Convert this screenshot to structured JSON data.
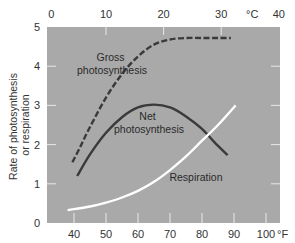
{
  "chart_data": {
    "type": "line",
    "title": "",
    "xlabel": "°F",
    "xlabel_top": "°C",
    "ylabel": "Rate of photosynthesis or respiration",
    "ylabel_lines": [
      "Rate of photosynthesis",
      "or respiration"
    ],
    "xlim_f": [
      32,
      104
    ],
    "ylim": [
      0,
      5
    ],
    "x_ticks_bottom": [
      40,
      50,
      60,
      70,
      80,
      90,
      100
    ],
    "x_ticks_bottom_labels": [
      "40",
      "50",
      "60",
      "70",
      "80",
      "90",
      "100"
    ],
    "x_ticks_top_c": [
      0,
      10,
      20,
      30,
      40
    ],
    "x_ticks_top_labels": [
      "0",
      "10",
      "20",
      "30",
      "40"
    ],
    "y_ticks": [
      0,
      1,
      2,
      3,
      4,
      5
    ],
    "y_ticks_labels": [
      "0",
      "1",
      "2",
      "3",
      "4",
      "5"
    ],
    "grid": false,
    "legend": "inline labels",
    "background": "#a9a9a9",
    "series": [
      {
        "name": "Gross photosynthesis",
        "label_lines": [
          "Gross",
          "photosynthesis"
        ],
        "style": "dashed",
        "color": "#3a3a3a",
        "x": [
          39.5,
          42,
          45,
          50,
          55,
          60,
          65,
          70,
          75,
          80,
          85,
          89
        ],
        "values": [
          1.55,
          1.95,
          2.45,
          3.2,
          3.8,
          4.25,
          4.55,
          4.68,
          4.72,
          4.72,
          4.72,
          4.72
        ]
      },
      {
        "name": "Net photosynthesis",
        "label_lines": [
          "Net",
          "photosynthesis"
        ],
        "style": "solid",
        "color": "#3a3a3a",
        "x": [
          41,
          45,
          50,
          55,
          60,
          65,
          70,
          75,
          80,
          84,
          88
        ],
        "values": [
          1.2,
          1.75,
          2.3,
          2.7,
          2.95,
          3.02,
          2.95,
          2.72,
          2.4,
          2.05,
          1.73
        ]
      },
      {
        "name": "Respiration",
        "label_lines": [
          "Respiration"
        ],
        "style": "solid",
        "color": "#ffffff",
        "x": [
          38,
          45,
          50,
          55,
          60,
          65,
          70,
          75,
          80,
          85,
          90.5
        ],
        "values": [
          0.33,
          0.42,
          0.52,
          0.65,
          0.82,
          1.05,
          1.35,
          1.7,
          2.1,
          2.5,
          3.0
        ]
      }
    ]
  }
}
